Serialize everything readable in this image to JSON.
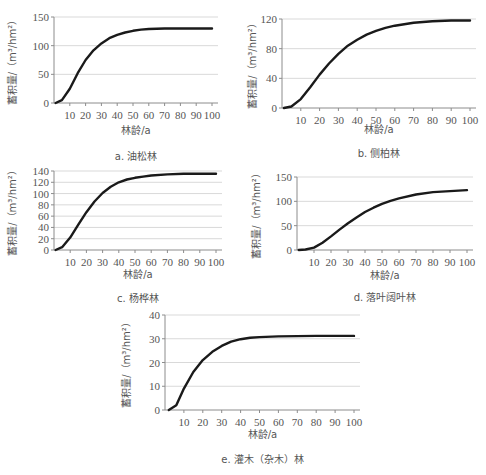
{
  "figure": {
    "panels_count": 5
  },
  "chart_data": [
    {
      "id": "a",
      "type": "line",
      "caption": "a. 油松林",
      "title": "",
      "xlabel": "林龄/a",
      "ylabel": "蓄积量/（m³/hm²）",
      "ylim": [
        0,
        150
      ],
      "yticks": [
        0,
        50,
        100,
        150
      ],
      "xlim": [
        0,
        100
      ],
      "xticks": [
        10,
        20,
        30,
        40,
        50,
        60,
        70,
        80,
        90,
        100
      ],
      "grid": true,
      "x": [
        1,
        5,
        10,
        15,
        20,
        25,
        30,
        35,
        40,
        45,
        50,
        55,
        60,
        70,
        80,
        90,
        100
      ],
      "series": [
        {
          "name": "油松林",
          "values": [
            0,
            5,
            25,
            52,
            75,
            92,
            104,
            113,
            119,
            123,
            126,
            128,
            129,
            130,
            130,
            130,
            130
          ]
        }
      ]
    },
    {
      "id": "b",
      "type": "line",
      "caption": "b. 侧柏林",
      "title": "",
      "xlabel": "林龄/a",
      "ylabel": "蓄积量/（m³/hm²）",
      "ylim": [
        0,
        120
      ],
      "yticks": [
        0,
        40,
        80,
        120
      ],
      "xlim": [
        0,
        100
      ],
      "xticks": [
        10,
        20,
        30,
        40,
        50,
        60,
        70,
        80,
        90,
        100
      ],
      "grid": true,
      "x": [
        1,
        5,
        10,
        15,
        20,
        25,
        30,
        35,
        40,
        45,
        50,
        55,
        60,
        70,
        80,
        90,
        100
      ],
      "series": [
        {
          "name": "侧柏林",
          "values": [
            0,
            2,
            12,
            28,
            45,
            60,
            73,
            84,
            92,
            99,
            104,
            108,
            111,
            115,
            117,
            118,
            118
          ]
        }
      ]
    },
    {
      "id": "c",
      "type": "line",
      "caption": "c. 杨桦林",
      "title": "",
      "xlabel": "林龄/a",
      "ylabel": "蓄积量/（m³/hm²）",
      "ylim": [
        0,
        140
      ],
      "yticks": [
        0,
        20,
        40,
        60,
        80,
        100,
        120,
        140
      ],
      "xlim": [
        0,
        100
      ],
      "xticks": [
        10,
        20,
        30,
        40,
        50,
        60,
        70,
        80,
        90,
        100
      ],
      "grid": true,
      "x": [
        1,
        5,
        10,
        15,
        20,
        25,
        30,
        35,
        40,
        45,
        50,
        55,
        60,
        70,
        80,
        90,
        100
      ],
      "series": [
        {
          "name": "杨桦林",
          "values": [
            0,
            5,
            22,
            45,
            67,
            86,
            101,
            112,
            120,
            125,
            128,
            130,
            132,
            134,
            135,
            135,
            135
          ]
        }
      ]
    },
    {
      "id": "d",
      "type": "line",
      "caption": "d. 落叶阔叶林",
      "title": "",
      "xlabel": "林龄/a",
      "ylabel": "蓄积量/（m³/hm²）",
      "ylim": [
        0,
        150
      ],
      "yticks": [
        0,
        50,
        100,
        150
      ],
      "xlim": [
        0,
        100
      ],
      "xticks": [
        10,
        20,
        30,
        40,
        50,
        60,
        70,
        80,
        90,
        100
      ],
      "grid": true,
      "x": [
        1,
        5,
        10,
        15,
        20,
        25,
        30,
        35,
        40,
        45,
        50,
        55,
        60,
        70,
        80,
        90,
        100
      ],
      "series": [
        {
          "name": "落叶阔叶林",
          "values": [
            0,
            1,
            5,
            15,
            28,
            42,
            55,
            67,
            78,
            87,
            95,
            101,
            106,
            114,
            119,
            121,
            123
          ]
        }
      ]
    },
    {
      "id": "e",
      "type": "line",
      "caption": "e. 灌木（杂木）林",
      "title": "",
      "xlabel": "林龄/a",
      "ylabel": "蓄积量/（m³/hm²）",
      "ylim": [
        0,
        40
      ],
      "yticks": [
        0,
        10,
        20,
        30,
        40
      ],
      "xlim": [
        0,
        100
      ],
      "xticks": [
        10,
        20,
        30,
        40,
        50,
        60,
        70,
        80,
        90,
        100
      ],
      "grid": true,
      "x": [
        2,
        6,
        10,
        15,
        20,
        25,
        30,
        35,
        40,
        45,
        50,
        60,
        70,
        80,
        90,
        100
      ],
      "series": [
        {
          "name": "灌木（杂木）林",
          "values": [
            0,
            2,
            9,
            16,
            21,
            24.5,
            27,
            28.8,
            29.8,
            30.4,
            30.7,
            31,
            31.1,
            31.2,
            31.2,
            31.2
          ]
        }
      ]
    }
  ],
  "layout": {
    "line_color": "#1a1a1a",
    "grid_color": "#d9d9d9",
    "axis_color": "#8c8c8c",
    "panels": [
      {
        "left": 54,
        "top": 17,
        "right": 218,
        "bottom": 103,
        "xlabel_y": 134,
        "caption_y": 160,
        "ylabel_x": 16
      },
      {
        "left": 282,
        "top": 19,
        "right": 476,
        "bottom": 108,
        "xlabel_y": 133,
        "caption_y": 157,
        "ylabel_x": 256
      },
      {
        "left": 54,
        "top": 171,
        "right": 222,
        "bottom": 250,
        "xlabel_y": 278,
        "caption_y": 302,
        "ylabel_x": 16
      },
      {
        "left": 297,
        "top": 177,
        "right": 473,
        "bottom": 250,
        "xlabel_y": 279,
        "caption_y": 301,
        "ylabel_x": 260
      },
      {
        "left": 165,
        "top": 315,
        "right": 360,
        "bottom": 410,
        "xlabel_y": 438,
        "caption_y": 463,
        "ylabel_x": 130
      }
    ]
  }
}
